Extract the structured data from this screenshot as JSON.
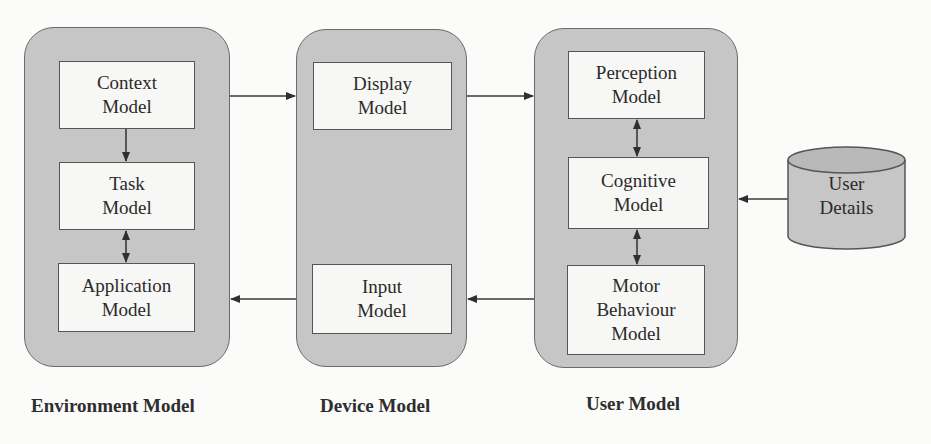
{
  "diagram": {
    "containers": [
      {
        "id": "environment",
        "caption": "Environment Model",
        "boxes": [
          {
            "id": "context",
            "lines": [
              "Context",
              "Model"
            ]
          },
          {
            "id": "task",
            "lines": [
              "Task",
              "Model"
            ]
          },
          {
            "id": "application",
            "lines": [
              "Application",
              "Model"
            ]
          }
        ]
      },
      {
        "id": "device",
        "caption": "Device Model",
        "boxes": [
          {
            "id": "display",
            "lines": [
              "Display",
              "Model"
            ]
          },
          {
            "id": "input",
            "lines": [
              "Input",
              "Model"
            ]
          }
        ]
      },
      {
        "id": "user",
        "caption": "User Model",
        "boxes": [
          {
            "id": "perception",
            "lines": [
              "Perception",
              "Model"
            ]
          },
          {
            "id": "cognitive",
            "lines": [
              "Cognitive",
              "Model"
            ]
          },
          {
            "id": "motor",
            "lines": [
              "Motor",
              "Behaviour",
              "Model"
            ]
          }
        ]
      }
    ],
    "datastore": {
      "id": "user-details",
      "lines": [
        "User",
        "Details"
      ]
    },
    "edges": [
      {
        "from": "context",
        "to": "task",
        "type": "one-way"
      },
      {
        "from": "task",
        "to": "application",
        "type": "two-way"
      },
      {
        "from": "environment",
        "to": "device",
        "type": "one-way",
        "note": "top arrow"
      },
      {
        "from": "device",
        "to": "user",
        "type": "one-way",
        "note": "top arrow"
      },
      {
        "from": "user",
        "to": "device",
        "type": "one-way",
        "note": "bottom arrow"
      },
      {
        "from": "device",
        "to": "environment",
        "type": "one-way",
        "note": "bottom arrow"
      },
      {
        "from": "perception",
        "to": "cognitive",
        "type": "two-way"
      },
      {
        "from": "cognitive",
        "to": "motor",
        "type": "two-way"
      },
      {
        "from": "user-details",
        "to": "user",
        "type": "one-way"
      }
    ],
    "colors": {
      "container_fill": "#c6c6c6",
      "box_fill": "#f7f7f5",
      "stroke": "#555555",
      "background": "#fbfbfa"
    }
  }
}
